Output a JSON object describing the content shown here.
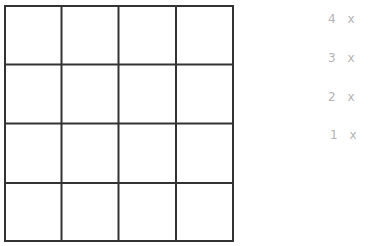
{
  "grid": {
    "rows": 4,
    "cols": 4,
    "line_color": "#333333"
  },
  "labels": [
    {
      "text": "4 x"
    },
    {
      "text": "3 x"
    },
    {
      "text": "2 x"
    },
    {
      "text": "1 x"
    }
  ]
}
